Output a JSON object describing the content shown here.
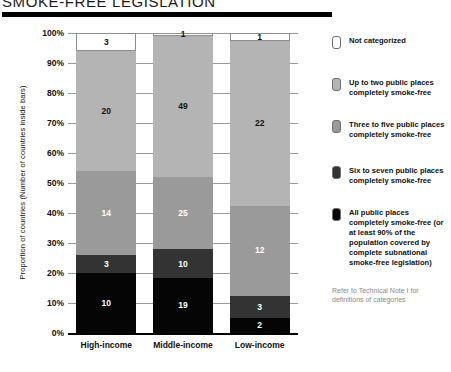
{
  "title": "SMOKE-FREE LEGISLATION",
  "legend": {
    "note": "Refer to Technical Note I for definitions of categories"
  },
  "chart_data": {
    "type": "bar",
    "stacked": true,
    "normalized": true,
    "title": "SMOKE-FREE LEGISLATION",
    "xlabel": "",
    "ylabel": "Proportion of countries (Number of countries inside bars)",
    "ylim": [
      0,
      100
    ],
    "ytick_labels": [
      "100%",
      "90%",
      "80%",
      "70%",
      "60%",
      "50%",
      "40%",
      "30%",
      "20%",
      "10%",
      "0%"
    ],
    "grid": true,
    "legend_position": "right",
    "categories": [
      "High-income",
      "Middle-income",
      "Low-income"
    ],
    "totals": [
      50,
      104,
      40
    ],
    "series": [
      {
        "name": "All public places completely smoke-free (or at least 90% of the population covered by complete subnational smoke-free legislation)",
        "color": "#050505",
        "label_color": "#ffffff",
        "values": [
          10,
          19,
          2
        ]
      },
      {
        "name": "Six to seven public places completely smoke-free",
        "color": "#333333",
        "label_color": "#ffffff",
        "values": [
          3,
          10,
          3
        ]
      },
      {
        "name": "Three to five public places completely smoke-free",
        "color": "#9a9a9a",
        "label_color": "#ffffff",
        "values": [
          14,
          25,
          12
        ]
      },
      {
        "name": "Up to two public places completely smoke-free",
        "color": "#b4b4b4",
        "label_color": "#111111",
        "values": [
          20,
          49,
          22
        ]
      },
      {
        "name": "Not categorized",
        "color": "#ffffff",
        "label_color": "#111111",
        "values": [
          3,
          1,
          1
        ]
      }
    ]
  }
}
